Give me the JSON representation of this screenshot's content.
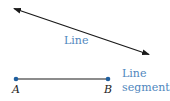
{
  "diagram": {
    "line": {
      "label": "Line",
      "start": [
        13,
        8
      ],
      "end": [
        150,
        55
      ],
      "arrowheads": "both"
    },
    "segment": {
      "label_line1": "Line",
      "label_line2": "segment",
      "point_a": {
        "name": "A",
        "x": 16,
        "y": 79
      },
      "point_b": {
        "name": "B",
        "x": 108,
        "y": 79
      }
    },
    "colors": {
      "stroke": "#1a1a1a",
      "label": "#4f86bd",
      "point": "#1f5f9f"
    }
  }
}
